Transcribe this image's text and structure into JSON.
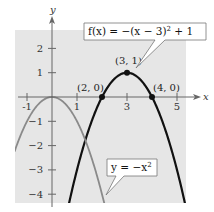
{
  "chart_data": {
    "type": "line",
    "title": "",
    "xlabel": "x",
    "ylabel": "y",
    "xlim": [
      -1.5,
      5.3
    ],
    "ylim": [
      -4.4,
      2.7
    ],
    "grid": false,
    "background_color": "#e6e6e6",
    "x_ticks": [
      -1,
      1,
      3,
      5
    ],
    "x_tick_labels": [
      "-1",
      "1",
      "3",
      "5"
    ],
    "y_ticks": [
      -4,
      -3,
      -2,
      -1,
      1,
      2
    ],
    "y_tick_labels": [
      "−4",
      "−3",
      "−2",
      "−1",
      "1",
      "2"
    ],
    "series": [
      {
        "name": "f(x) = −(x − 3)² + 1",
        "label_text": "f(x) = −(x − 3)",
        "label_exp": "2",
        "label_tail": " + 1",
        "color": "#111111",
        "function": "-(x-3)^2+1",
        "x_range": [
          0.6,
          5.4
        ]
      },
      {
        "name": "y = −x²",
        "label_text": "y = −x",
        "label_exp": "2",
        "label_tail": "",
        "color": "#8a8a8a",
        "function": "-x^2",
        "x_range": [
          -1.5,
          2.1
        ]
      }
    ],
    "points": [
      {
        "x": 2,
        "y": 0,
        "label": "(2, 0)"
      },
      {
        "x": 3,
        "y": 1,
        "label": "(3, 1)"
      },
      {
        "x": 4,
        "y": 0,
        "label": "(4, 0)"
      }
    ]
  }
}
